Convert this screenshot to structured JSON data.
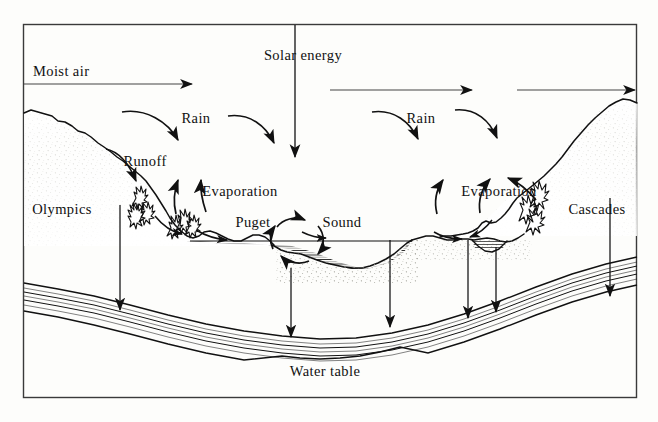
{
  "figure": {
    "frame": {
      "x": 23,
      "y": 24,
      "width": 614,
      "height": 374,
      "stroke_color": "#3a3a3a"
    },
    "background_color": "#fdfdfb",
    "ink_color": "#111111"
  },
  "labels": {
    "solar_energy": "Solar energy",
    "moist_air": "Moist air",
    "rain_left": "Rain",
    "rain_right": "Rain",
    "runoff": "Runoff",
    "evaporation_left": "Evaporation",
    "evaporation_right": "Evaporation",
    "olympics": "Olympics",
    "cascades": "Cascades",
    "puget": "Puget",
    "sound": "Sound",
    "water_table": "Water table"
  },
  "label_positions": {
    "solar_energy": {
      "x": 303,
      "y": 57,
      "anchor": "middle"
    },
    "moist_air": {
      "x": 33,
      "y": 73,
      "anchor": "start"
    },
    "rain_left": {
      "x": 196,
      "y": 120,
      "anchor": "middle"
    },
    "rain_right": {
      "x": 421,
      "y": 120,
      "anchor": "middle"
    },
    "runoff": {
      "x": 145,
      "y": 162,
      "anchor": "middle"
    },
    "evaporation_left": {
      "x": 240,
      "y": 193,
      "anchor": "middle"
    },
    "evaporation_right": {
      "x": 499,
      "y": 193,
      "anchor": "middle"
    },
    "olympics": {
      "x": 62,
      "y": 211,
      "anchor": "middle"
    },
    "cascades": {
      "x": 597,
      "y": 211,
      "anchor": "middle"
    },
    "puget": {
      "x": 253,
      "y": 224,
      "anchor": "middle"
    },
    "sound": {
      "x": 342,
      "y": 224,
      "anchor": "middle"
    },
    "water_table": {
      "x": 325,
      "y": 373,
      "anchor": "middle"
    }
  },
  "arrows": {
    "solar_energy_beam": {
      "type": "vertical-down",
      "x": 295,
      "y_from": 25,
      "y_to": 160
    },
    "moist_air_inflow": {
      "type": "horizontal-right",
      "y": 84,
      "x_from": 24,
      "x_to": 196
    },
    "moist_air_mid": {
      "type": "horizontal-right",
      "y": 90,
      "x_from": 330,
      "x_to": 475
    },
    "moist_air_east": {
      "type": "horizontal-right",
      "y": 90,
      "x_from": 517,
      "x_to": 637
    },
    "rain_left_curve": {
      "type": "curved-down-right"
    },
    "rain_right_curve": {
      "type": "curved-down-right"
    },
    "rain_far_right_curve": {
      "type": "curved-down-right"
    },
    "runoff_curve": {
      "type": "curved-down-right"
    },
    "evaporation_up_1": {
      "type": "curved-up"
    },
    "evaporation_up_2": {
      "type": "curved-up"
    },
    "evaporation_up_3": {
      "type": "curved-up"
    },
    "evaporation_up_4": {
      "type": "curved-up"
    },
    "evaporation_up_5": {
      "type": "curved-up"
    },
    "sound_circulation": {
      "type": "circular-clockwise",
      "cx": 297,
      "cy": 240,
      "r": 26
    },
    "infiltration": [
      {
        "x": 120,
        "y_from": 205,
        "y_to": 315
      },
      {
        "x": 291,
        "y_from": 243,
        "y_to": 340
      },
      {
        "x": 390,
        "y_from": 237,
        "y_to": 330
      },
      {
        "x": 468,
        "y_from": 232,
        "y_to": 322
      },
      {
        "x": 496,
        "y_from": 237,
        "y_to": 316
      },
      {
        "x": 610,
        "y_from": 200,
        "y_to": 300
      }
    ]
  },
  "terrain": {
    "olympics_label_side": "left",
    "cascades_label_side": "right",
    "sound_water_hatch_lines": 11,
    "aquifer_layer_lines": 7,
    "small_pond_present": true
  }
}
